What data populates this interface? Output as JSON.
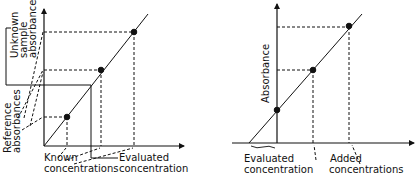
{
  "left_panel": {
    "title": "Calibration curve method",
    "labels": {
      "unknown_sample_absorbance": [
        "Unknown",
        "sample",
        "absorbance"
      ],
      "reference_absorbances": [
        "Reference",
        "absorbances"
      ],
      "known_concentrations": [
        "Known",
        "concentrations"
      ],
      "evaluated_concentration": [
        "Evaluated",
        "concentration"
      ]
    },
    "points": [
      {
        "role": "reference",
        "x": 67,
        "y": 117
      },
      {
        "role": "reference",
        "x": 101,
        "y": 70
      },
      {
        "role": "reference",
        "x": 134,
        "y": 32
      }
    ],
    "colors": {
      "line": "#111111",
      "background": "#ffffff"
    }
  },
  "right_panel": {
    "title": "Standard addition method",
    "labels": {
      "y_axis": "Absorbance",
      "evaluated_concentration": [
        "Evaluated",
        "concentration"
      ],
      "added_concentrations": [
        "Added",
        "concentrations"
      ]
    },
    "points": [
      {
        "role": "sample",
        "x": 277,
        "y": 110
      },
      {
        "role": "addition",
        "x": 313,
        "y": 70
      },
      {
        "role": "addition",
        "x": 349,
        "y": 26
      }
    ],
    "colors": {
      "line": "#111111",
      "background": "#ffffff"
    }
  }
}
